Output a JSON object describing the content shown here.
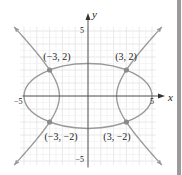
{
  "diagram": {
    "type": "coordinate-graph",
    "axes": {
      "x_label": "x",
      "y_label": "y",
      "x_ticks": [
        {
          "value": -5,
          "label": "−5"
        },
        {
          "value": 5,
          "label": "5"
        }
      ],
      "y_ticks": [
        {
          "value": 5,
          "label": "5"
        },
        {
          "value": -5,
          "label": "−5"
        }
      ],
      "range": {
        "xmin": -5,
        "xmax": 5,
        "ymin": -5,
        "ymax": 5
      },
      "grid": true
    },
    "curves": [
      {
        "name": "ellipse",
        "equation": "x^2 + 4y^2 = 25",
        "semi_x": 5,
        "semi_y": 2.5
      },
      {
        "name": "hyperbola",
        "equation": "x^2 - y^2 = 5",
        "a": 2.236
      }
    ],
    "points": [
      {
        "x": -3,
        "y": 2,
        "label": "(−3, 2)"
      },
      {
        "x": 3,
        "y": 2,
        "label": "(3, 2)"
      },
      {
        "x": -3,
        "y": -2,
        "label": "(−3, −2)"
      },
      {
        "x": 3,
        "y": -2,
        "label": "(3, −2)"
      }
    ],
    "colors": {
      "curve": "#9a9a9a",
      "axis": "#555555",
      "grid": "#e2e2e2",
      "point": "#8a8a8a",
      "text": "#222222",
      "arrow": "#333333",
      "border": "#9a9a9a"
    }
  }
}
